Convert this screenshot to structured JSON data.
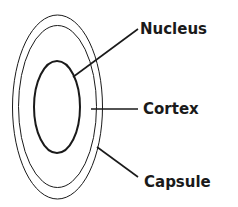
{
  "diagram": {
    "labels": {
      "nucleus": "Nucleus",
      "cortex": "Cortex",
      "capsule": "Capsule"
    },
    "colors": {
      "stroke": "#1a1a1a",
      "background": "#ffffff"
    }
  }
}
